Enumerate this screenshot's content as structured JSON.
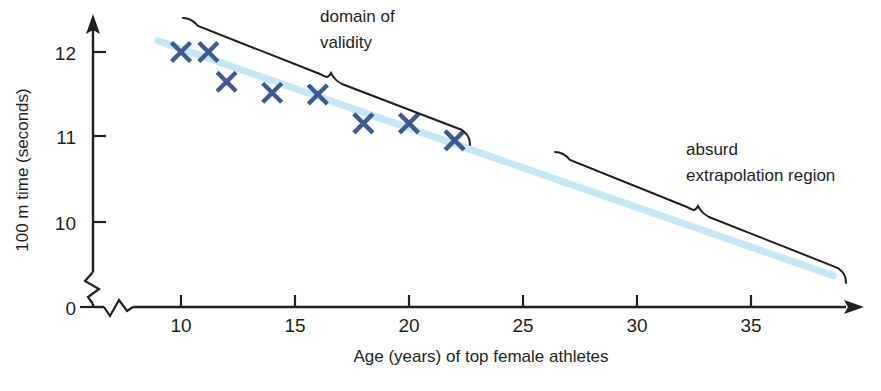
{
  "chart_data": {
    "type": "scatter",
    "title": "",
    "xlabel": "Age (years) of top female athletes",
    "ylabel": "100 m time (seconds)",
    "xlim": [
      8.7,
      39.0
    ],
    "ylim": [
      0,
      12.45
    ],
    "x_ticks": [
      10,
      15,
      20,
      25,
      30,
      35
    ],
    "y_ticks": [
      0,
      10,
      11,
      12
    ],
    "grid": false,
    "legend_position": "none",
    "axis_breaks": {
      "x_axis": true,
      "y_axis": true
    },
    "series": [
      {
        "name": "top female athlete 100 m times",
        "marker": "x",
        "color": "#3d5a96",
        "points": [
          {
            "x": 10.0,
            "y": 12.0
          },
          {
            "x": 11.2,
            "y": 12.0
          },
          {
            "x": 12.0,
            "y": 11.65
          },
          {
            "x": 14.0,
            "y": 11.52
          },
          {
            "x": 16.0,
            "y": 11.5
          },
          {
            "x": 18.0,
            "y": 11.16
          },
          {
            "x": 20.0,
            "y": 11.16
          },
          {
            "x": 22.0,
            "y": 10.96
          }
        ]
      },
      {
        "name": "linear trend line (extrapolated)",
        "marker": "line",
        "color": "#c5e8f7",
        "points": [
          {
            "x": 9.0,
            "y": 12.13
          },
          {
            "x": 38.6,
            "y": 9.37
          }
        ]
      }
    ],
    "annotations": [
      {
        "id": "domain-of-validity",
        "text_lines": [
          "domain of",
          "validity"
        ],
        "brace_span_x": [
          10.0,
          22.6
        ],
        "brace_side": "above"
      },
      {
        "id": "absurd-extrapolation-region",
        "text_lines": [
          "absurd",
          "extrapolation region"
        ],
        "brace_span_x": [
          26.7,
          39.0
        ],
        "brace_side": "above"
      }
    ]
  },
  "axes": {
    "x_tick_labels": [
      "10",
      "15",
      "20",
      "25",
      "30",
      "35"
    ],
    "y_tick_labels": [
      "0",
      "10",
      "11",
      "12"
    ],
    "x_title": "Age (years) of top female athletes",
    "y_title": "100 m time (seconds)"
  },
  "annotations": {
    "left": {
      "line1": "domain of",
      "line2": "validity"
    },
    "right": {
      "line1": "absurd",
      "line2": "extrapolation region"
    }
  },
  "colors": {
    "marker": "#3d5a96",
    "trend_line": "#c5e8f7",
    "axis": "#231f20",
    "text": "#231f20",
    "background": "#ffffff"
  }
}
